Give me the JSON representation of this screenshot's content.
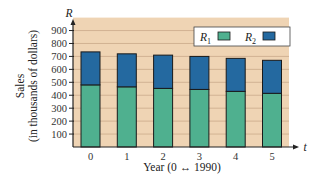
{
  "chart_data": {
    "type": "bar",
    "stacked": true,
    "title": "",
    "xlabel": "Year (0 ↔ 1990)",
    "ylabel_line1": "Sales",
    "ylabel_line2": "(in thousands of dollars)",
    "y_axis_symbol": "R",
    "x_axis_symbol": "t",
    "categories": [
      "0",
      "1",
      "2",
      "3",
      "4",
      "5"
    ],
    "series": [
      {
        "name": "R1",
        "label_main": "R",
        "label_sub": "1",
        "color": "#4fb08f",
        "values": [
          480,
          465,
          453,
          445,
          430,
          415
        ]
      },
      {
        "name": "R2",
        "label_main": "R",
        "label_sub": "2",
        "color": "#2469a0",
        "values": [
          255,
          255,
          257,
          255,
          255,
          255
        ]
      }
    ],
    "totals": [
      735,
      720,
      710,
      700,
      685,
      670
    ],
    "yticks": [
      100,
      200,
      300,
      400,
      500,
      600,
      700,
      800,
      900
    ],
    "ylim": [
      0,
      1000
    ],
    "grid": true,
    "legend_position": "top-right inside",
    "background_color": "#efd4b4",
    "grid_color": "#c9a98a"
  }
}
